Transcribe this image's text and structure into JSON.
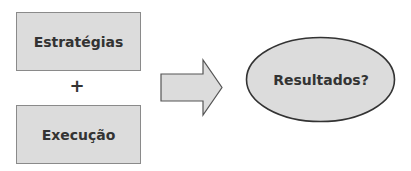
{
  "diagram": {
    "box_top": {
      "label": "Estratégias"
    },
    "operator": {
      "label": "+"
    },
    "box_bottom": {
      "label": "Execução"
    },
    "arrow": {
      "direction": "right"
    },
    "ellipse": {
      "label": "Resultados?"
    }
  },
  "colors": {
    "fill": "#dcdcdc",
    "stroke": "#333333",
    "text": "#333333"
  }
}
